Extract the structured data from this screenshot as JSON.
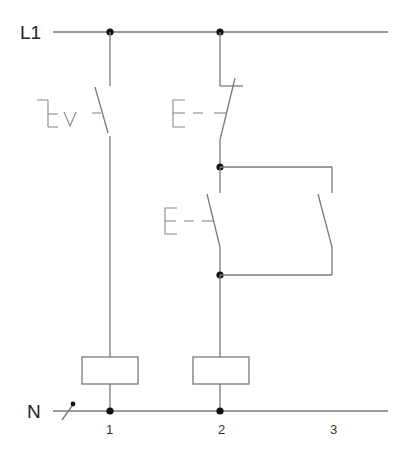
{
  "diagram": {
    "type": "ladder-circuit",
    "rails": {
      "top": {
        "label": "L1"
      },
      "bottom": {
        "label": "N"
      }
    },
    "rungs": [
      {
        "number": "1",
        "elements": [
          "rotary-switch-NO",
          "coil"
        ]
      },
      {
        "number": "2",
        "elements": [
          "pushbutton-NC",
          "pushbutton-NO",
          "self-holding-contact-NO",
          "coil"
        ]
      },
      {
        "number": "3",
        "elements": []
      }
    ],
    "colors": {
      "wire": "#7a7a7a",
      "node": "#111111",
      "background": "#ffffff"
    }
  }
}
